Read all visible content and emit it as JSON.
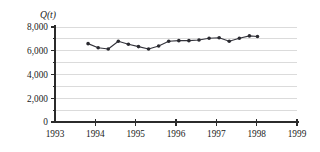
{
  "chart_data": {
    "type": "line",
    "title": "",
    "subtitle": "",
    "ylabel": "Q(t)",
    "xlabel": "",
    "axis_title_display": "Q(t)",
    "xlim": [
      1993,
      1999
    ],
    "ylim": [
      0,
      8000
    ],
    "grid": true,
    "grid_axis": "y",
    "legend": "none",
    "y_major_ticks": [
      0,
      2000,
      4000,
      6000,
      8000
    ],
    "y_minor_ticks": [
      1000,
      3000,
      5000,
      7000
    ],
    "y_tick_labels": [
      "0",
      "2,000",
      "4,000",
      "6,000",
      "8,000"
    ],
    "x_ticks": [
      1993,
      1994,
      1995,
      1996,
      1997,
      1998,
      1999
    ],
    "x_tick_labels": [
      "1993",
      "1994",
      "1995",
      "1996",
      "1997",
      "1998",
      "1999"
    ],
    "marker": "filled-circle",
    "series": [
      {
        "name": "Q(t)",
        "color": "#2a2a30",
        "x": [
          1993.82,
          1994.07,
          1994.32,
          1994.57,
          1994.82,
          1995.07,
          1995.32,
          1995.57,
          1995.82,
          1996.07,
          1996.32,
          1996.57,
          1996.82,
          1997.07,
          1997.32,
          1997.57,
          1997.82,
          1998.02
        ],
        "values": [
          6600,
          6250,
          6150,
          6800,
          6550,
          6350,
          6150,
          6400,
          6800,
          6850,
          6850,
          6900,
          7050,
          7100,
          6800,
          7050,
          7250,
          7200
        ]
      }
    ]
  },
  "geometry": {
    "plot_left_px": 55,
    "plot_right_px": 297,
    "plot_top_px": 27,
    "plot_bottom_px": 122
  }
}
